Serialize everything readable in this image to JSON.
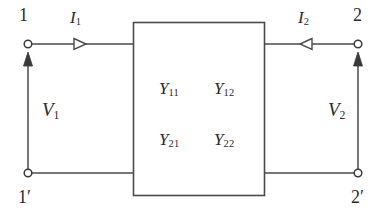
{
  "diagram": {
    "type": "two-port-network",
    "colors": {
      "line": "#4a4a4a",
      "text": "#2b2b2b",
      "background": "#ffffff",
      "box_fill": "#ffffff"
    },
    "ports": {
      "top_left_terminal": "1",
      "bottom_left_terminal": "1′",
      "top_right_terminal": "2",
      "bottom_right_terminal": "2′"
    },
    "currents": [
      {
        "symbol": "I",
        "subscript": "1",
        "direction": "right",
        "arrow_style": "hollow-triangle"
      },
      {
        "symbol": "I",
        "subscript": "2",
        "direction": "left",
        "arrow_style": "hollow-triangle"
      }
    ],
    "voltages": [
      {
        "symbol": "V",
        "subscript": "1",
        "direction": "up",
        "arrow_style": "solid"
      },
      {
        "symbol": "V",
        "subscript": "2",
        "direction": "up",
        "arrow_style": "solid"
      }
    ],
    "admittance_matrix": {
      "symbol": "Y",
      "entries": [
        [
          {
            "symbol": "Y",
            "subscript": "11"
          },
          {
            "symbol": "Y",
            "subscript": "12"
          }
        ],
        [
          {
            "symbol": "Y",
            "subscript": "21"
          },
          {
            "symbol": "Y",
            "subscript": "22"
          }
        ]
      ]
    }
  }
}
